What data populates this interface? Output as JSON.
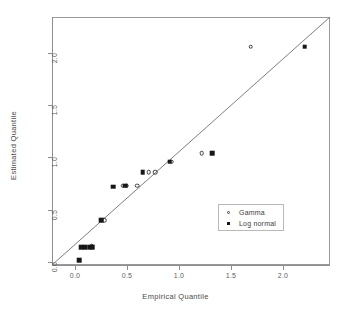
{
  "chart_data": {
    "type": "scatter",
    "title": "",
    "xlabel": "Empirical Quantile",
    "ylabel": "Estimated Quantile",
    "xlim": [
      -0.12,
      2.45
    ],
    "ylim": [
      -0.12,
      2.45
    ],
    "grid": false,
    "legend_position": "bottom-right",
    "annotations": [
      {
        "type": "line",
        "name": "identity-reference-line",
        "from": [
          -0.12,
          -0.12
        ],
        "to": [
          2.45,
          2.45
        ]
      }
    ],
    "xticks": [
      0.0,
      0.5,
      1.0,
      1.5,
      2.0
    ],
    "xticklabels": [
      "0.0",
      "0.5",
      "1.0",
      "1.5",
      "2.0"
    ],
    "yticks": [
      0.0,
      0.5,
      1.0,
      1.5,
      2.0
    ],
    "yticklabels": [
      "0.0",
      "0.5",
      "1.0",
      "1.5",
      "2.0"
    ],
    "series": [
      {
        "name": "Gamma",
        "marker": "open-circle",
        "color": "#3a3a3a",
        "points": [
          [
            0.16,
            0.15
          ],
          [
            0.28,
            0.4
          ],
          [
            0.46,
            0.73
          ],
          [
            0.49,
            0.73
          ],
          [
            0.6,
            0.73
          ],
          [
            0.71,
            0.86
          ],
          [
            0.77,
            0.86
          ],
          [
            0.93,
            0.96
          ],
          [
            1.22,
            1.04
          ],
          [
            1.69,
            2.06
          ]
        ]
      },
      {
        "name": "Log normal",
        "marker": "filled-square",
        "color": "#171717",
        "points": [
          [
            0.04,
            0.02
          ],
          [
            0.06,
            0.14
          ],
          [
            0.1,
            0.14
          ],
          [
            0.14,
            0.14
          ],
          [
            0.17,
            0.14
          ],
          [
            0.25,
            0.4
          ],
          [
            0.37,
            0.72
          ],
          [
            0.48,
            0.73
          ],
          [
            0.65,
            0.86
          ],
          [
            0.91,
            0.96
          ],
          [
            1.32,
            1.04
          ],
          [
            2.21,
            2.06
          ]
        ]
      }
    ]
  },
  "legend": {
    "entries": [
      {
        "label": "Gamma",
        "marker": "open-circle"
      },
      {
        "label": "Log normal",
        "marker": "filled-square"
      }
    ]
  }
}
